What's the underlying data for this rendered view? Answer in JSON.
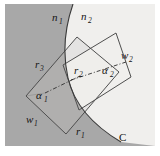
{
  "figure": {
    "caption_free": true,
    "canvas": {
      "width": 160,
      "height": 156
    },
    "colors": {
      "page_background": "#ffffff",
      "region_n1_fill": "#a8a8a8",
      "region_n2_fill": "#f0efed",
      "overlap_fill": "#c4c3c1",
      "outline": "#4a4a4a",
      "curve_stroke": "#3a3a3a",
      "label_color": "#141414",
      "frame_border": "#d8d8d8"
    },
    "regions": [
      {
        "name": "n1",
        "label": "n",
        "subscript": "1",
        "description": "left darker medium",
        "label_x": 55,
        "label_y": 20
      },
      {
        "name": "n2",
        "label": "n",
        "subscript": "2",
        "description": "right lighter medium",
        "label_x": 84,
        "label_y": 19
      }
    ],
    "interface": {
      "name": "C",
      "label": "C",
      "label_x": 122,
      "label_y": 138
    },
    "rectangles": [
      {
        "name": "window-1",
        "label": "w",
        "subscript": "1",
        "label_x": 28,
        "label_y": 120,
        "angle_label": "α",
        "angle_subscript": "1",
        "angle_label_x": 38,
        "angle_label_y": 96,
        "radius_label": "r",
        "radius_subscript": "3",
        "radius_label_x": 37,
        "radius_label_y": 66
      },
      {
        "name": "window-2",
        "label": "w",
        "subscript": "2",
        "label_x": 124,
        "label_y": 57,
        "angle_label": "α",
        "angle_subscript": "2",
        "angle_label_x": 104,
        "angle_label_y": 73,
        "radius_label": "r",
        "radius_subscript": "2",
        "radius_label_x": 76,
        "radius_label_y": 72
      }
    ],
    "extra_labels": [
      {
        "name": "f1-label",
        "label": "r",
        "subscript": "1",
        "x": 78,
        "y": 133
      }
    ],
    "geometry": {
      "curve_path": "M 73 4 C 64 30 63 56 68 78 C 74 104 94 126 121 142",
      "rect1_points": "26,96 77,37 119,72 66,134",
      "rect2_points": "63,65 116,33 131,77 79,110",
      "dashdot_1": "M 45 93 L 80 76",
      "dashdot_2": "M 73 79 L 126 62"
    }
  }
}
